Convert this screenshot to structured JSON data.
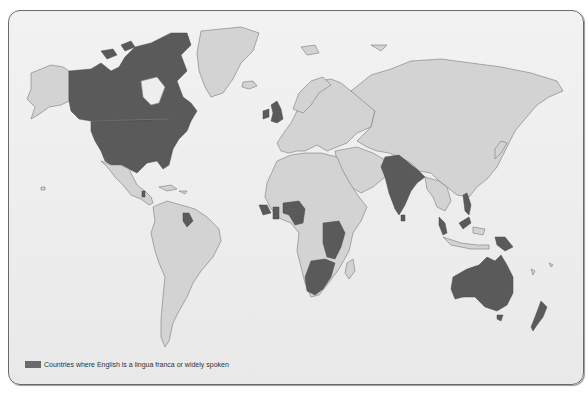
{
  "map": {
    "title": "World map of English usage",
    "land_color": "#d3d3d3",
    "highlight_color": "#5a5a5a",
    "background_color": "#eeeeee",
    "highlighted_regions": [
      "Canada",
      "United States",
      "Belize",
      "Guyana",
      "United Kingdom",
      "Ireland",
      "Sierra Leone",
      "Liberia",
      "Ghana",
      "Nigeria",
      "Cameroon",
      "Kenya",
      "Uganda",
      "Tanzania",
      "Zambia",
      "Malawi",
      "Zimbabwe",
      "Botswana",
      "South Africa",
      "Mozambique",
      "India",
      "Pakistan",
      "Bangladesh",
      "Sri Lanka",
      "Malaysia",
      "Philippines",
      "Papua New Guinea",
      "Australia",
      "New Zealand"
    ]
  },
  "legend": {
    "swatch_color": "#6b6b6b",
    "label": "Countries where English is a lingua franca or widely spoken"
  }
}
